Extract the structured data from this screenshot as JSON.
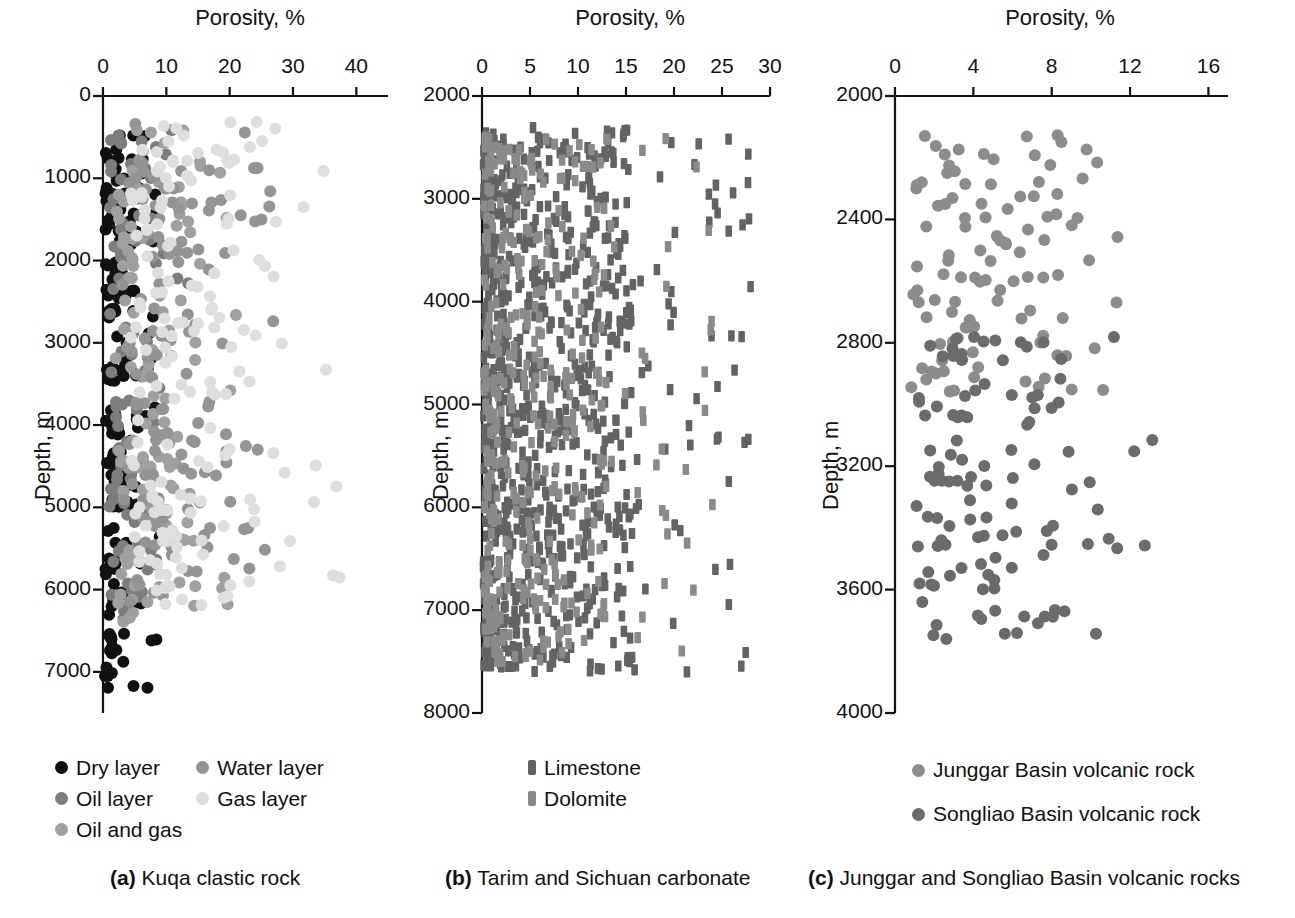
{
  "figure": {
    "panels": [
      {
        "id": "a",
        "caption_tag": "(a)",
        "caption_text": "Kuqa clastic rock",
        "chart_data": {
          "type": "scatter",
          "title": "",
          "xlabel": "Porosity, %",
          "ylabel": "Depth, m",
          "xlim": [
            0,
            45
          ],
          "ylim": [
            0,
            7500
          ],
          "y_inverted": true,
          "grid": false,
          "xticks": [
            0,
            10,
            20,
            30,
            40
          ],
          "xtick_labels": [
            "0",
            "10",
            "20",
            "30",
            "40"
          ],
          "yticks": [
            0,
            1000,
            2000,
            3000,
            4000,
            5000,
            6000,
            7000
          ],
          "ytick_labels": [
            "0",
            "1000",
            "2000",
            "3000",
            "4000",
            "5000",
            "6000",
            "7000"
          ],
          "legend_position": "below-left",
          "series": [
            {
              "name": "Dry layer",
              "color": "#111111",
              "marker": "circle",
              "n": 185,
              "x_range": [
                0.3,
                9.5
              ],
              "x_mode": 2.6,
              "y_range": [
                350,
                7200
              ]
            },
            {
              "name": "Oil layer",
              "color": "#7d7d7d",
              "marker": "circle",
              "n": 95,
              "x_range": [
                1.0,
                14.0
              ],
              "x_mode": 6.0,
              "y_range": [
                400,
                6500
              ]
            },
            {
              "name": "Oil and gas",
              "color": "#a0a0a0",
              "marker": "circle",
              "n": 110,
              "x_range": [
                2.0,
                22.0
              ],
              "x_mode": 9.0,
              "y_range": [
                400,
                6400
              ]
            },
            {
              "name": "Water  layer",
              "color": "#949494",
              "marker": "circle",
              "n": 130,
              "x_range": [
                3.0,
                27.0
              ],
              "x_mode": 13.0,
              "y_range": [
                300,
                6300
              ]
            },
            {
              "name": "Gas  layer",
              "color": "#dedede",
              "marker": "circle",
              "n": 160,
              "x_range": [
                4.0,
                40.0
              ],
              "x_mode": 15.0,
              "y_range": [
                300,
                6200
              ]
            }
          ]
        }
      },
      {
        "id": "b",
        "caption_tag": "(b)",
        "caption_text": "Tarim and Sichuan carbonate",
        "chart_data": {
          "type": "scatter",
          "title": "",
          "xlabel": "Porosity, %",
          "ylabel": "Depth, m",
          "xlim": [
            0,
            30
          ],
          "ylim": [
            2000,
            8000
          ],
          "y_inverted": true,
          "grid": false,
          "xticks": [
            0,
            5,
            10,
            15,
            20,
            25,
            30
          ],
          "xtick_labels": [
            "0",
            "5",
            "10",
            "15",
            "20",
            "25",
            "30"
          ],
          "yticks": [
            2000,
            3000,
            4000,
            5000,
            6000,
            7000,
            8000
          ],
          "ytick_labels": [
            "2000",
            "3000",
            "4000",
            "5000",
            "6000",
            "7000",
            "8000"
          ],
          "legend_position": "below-center",
          "series": [
            {
              "name": "Limestone",
              "color": "#636363",
              "marker": "rect",
              "n": 900,
              "x_range": [
                0.1,
                28.0
              ],
              "x_mode": 0.8,
              "y_range": [
                2300,
                7600
              ]
            },
            {
              "name": "Dolomite",
              "color": "#8a8a8a",
              "marker": "rect",
              "n": 420,
              "x_range": [
                0.2,
                24.0
              ],
              "x_mode": 1.4,
              "y_range": [
                2400,
                7500
              ]
            }
          ]
        }
      },
      {
        "id": "c",
        "caption_tag": "(c)",
        "caption_text": "Junggar and Songliao Basin volcanic rocks",
        "chart_data": {
          "type": "scatter",
          "title": "",
          "xlabel": "Porosity, %",
          "ylabel": "Depth, m",
          "xlim": [
            0,
            17
          ],
          "ylim": [
            2000,
            4000
          ],
          "y_inverted": true,
          "grid": false,
          "xticks": [
            0,
            4,
            8,
            12,
            16
          ],
          "xtick_labels": [
            "0",
            "4",
            "8",
            "12",
            "16"
          ],
          "yticks": [
            2000,
            2400,
            2800,
            3200,
            3600,
            4000
          ],
          "ytick_labels": [
            "2000",
            "2400",
            "2800",
            "3200",
            "3600",
            "4000"
          ],
          "legend_position": "below-center",
          "series": [
            {
              "name": "Junggar Basin volcanic rock",
              "color": "#8c8c8c",
              "marker": "circle",
              "n": 105,
              "x_range": [
                0.8,
                15.5
              ],
              "x_mode": 5.0,
              "y_range": [
                2120,
                2960
              ]
            },
            {
              "name": "Songliao Basin volcanic rock",
              "color": "#6b6b6b",
              "marker": "circle",
              "n": 115,
              "x_range": [
                1.0,
                13.5
              ],
              "x_mode": 5.5,
              "y_range": [
                2780,
                3760
              ]
            }
          ]
        }
      }
    ]
  }
}
